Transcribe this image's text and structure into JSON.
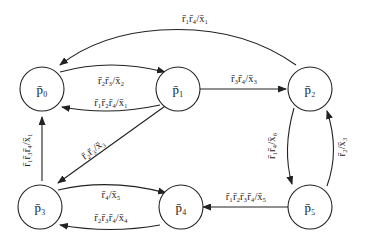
{
  "diagram": {
    "type": "state-transition-graph",
    "nodes": [
      {
        "id": "p0",
        "label": "p̄₀"
      },
      {
        "id": "p1",
        "label": "p̄₁"
      },
      {
        "id": "p2",
        "label": "p̄₂"
      },
      {
        "id": "p3",
        "label": "p̄₃"
      },
      {
        "id": "p4",
        "label": "p̄₄"
      },
      {
        "id": "p5",
        "label": "p̄₅"
      }
    ],
    "edges": [
      {
        "from": "p2",
        "to": "p0",
        "label": "r̄₁r̄₄/x̄₁"
      },
      {
        "from": "p0",
        "to": "p1",
        "label": "r̄₂r̄₃/x̄₂"
      },
      {
        "from": "p1",
        "to": "p0",
        "label": "r̄₁r̄₂r̄₄/x̄₁"
      },
      {
        "from": "p1",
        "to": "p2",
        "label": "r̄₃r̄₄/x̄₃"
      },
      {
        "from": "p1",
        "to": "p3",
        "label": "r̄₂r̄₃/x̄₃"
      },
      {
        "from": "p3",
        "to": "p0",
        "label": "r̄₁r̄₃r̄₄/x̄₁"
      },
      {
        "from": "p2",
        "to": "p5",
        "label": "r̄₁r̄₄/x̄₆"
      },
      {
        "from": "p5",
        "to": "p2",
        "label": "r̄₂/x̄₃"
      },
      {
        "from": "p3",
        "to": "p4",
        "label": "r̄₄/x̄₅"
      },
      {
        "from": "p4",
        "to": "p3",
        "label": "r̄₂r̄₃r̄₄/x̄₄"
      },
      {
        "from": "p5",
        "to": "p4",
        "label": "r̄₁r̄₂r̄₃r̄₄/x̄₅"
      }
    ]
  }
}
